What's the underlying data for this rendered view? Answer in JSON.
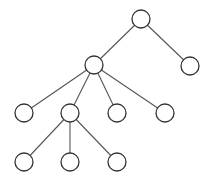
{
  "diagram": {
    "type": "tree",
    "colors": {
      "edge": "#555555",
      "node_stroke": "#333333",
      "node_fill": "#ffffff",
      "background": "#ffffff"
    },
    "node_radius": 9,
    "nodes": [
      {
        "id": "root",
        "x": 141,
        "y": 19
      },
      {
        "id": "a",
        "x": 94,
        "y": 65
      },
      {
        "id": "b",
        "x": 190,
        "y": 66
      },
      {
        "id": "a1",
        "x": 24,
        "y": 113
      },
      {
        "id": "a2",
        "x": 70,
        "y": 113
      },
      {
        "id": "a3",
        "x": 117,
        "y": 113
      },
      {
        "id": "a4",
        "x": 165,
        "y": 113
      },
      {
        "id": "a2a",
        "x": 24,
        "y": 162
      },
      {
        "id": "a2b",
        "x": 70,
        "y": 162
      },
      {
        "id": "a2c",
        "x": 117,
        "y": 162
      }
    ],
    "edges": [
      [
        "root",
        "a"
      ],
      [
        "root",
        "b"
      ],
      [
        "a",
        "a1"
      ],
      [
        "a",
        "a2"
      ],
      [
        "a",
        "a3"
      ],
      [
        "a",
        "a4"
      ],
      [
        "a2",
        "a2a"
      ],
      [
        "a2",
        "a2b"
      ],
      [
        "a2",
        "a2c"
      ]
    ]
  }
}
